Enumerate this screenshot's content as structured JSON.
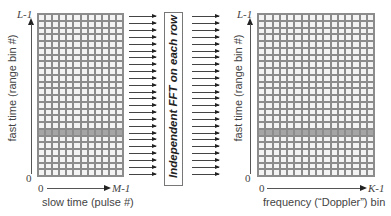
{
  "left_panel": {
    "y_axis": {
      "top_label": "L-1",
      "bottom_label": "0",
      "title": "fast time (range bin #)"
    },
    "x_axis": {
      "left_label": "0",
      "right_label": "M-1",
      "title": "slow time (pulse #)"
    },
    "grid": {
      "rows": 24,
      "cols": 12,
      "highlighted_row_from_top": 17
    }
  },
  "middle": {
    "operation_label": "Independent FFT on each row",
    "arrow_count": 24
  },
  "right_panel": {
    "y_axis": {
      "top_label": "L-1",
      "bottom_label": "0",
      "title": "fast time (range bin #)"
    },
    "x_axis": {
      "left_label": "0",
      "right_label": "K-1",
      "title": "frequency (“Doppler”) bin"
    },
    "grid": {
      "rows": 24,
      "cols": 16,
      "highlighted_row_from_top": 17
    }
  },
  "colors": {
    "grid_line": "#8c8c8c",
    "cell": "#f3f3f3",
    "highlight_cell": "#a5a5a5",
    "text": "#333333"
  }
}
